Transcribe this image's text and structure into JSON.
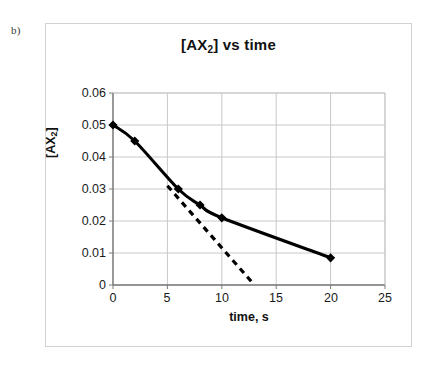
{
  "panel": {
    "label": "b)"
  },
  "chart_data": {
    "type": "line",
    "title": "[AX2] vs time",
    "title_main": "[AX",
    "title_sub": "2",
    "title_tail": "] vs time",
    "xlabel": "time, s",
    "ylabel": "[AX2]",
    "ylabel_main": "[AX",
    "ylabel_sub": "2",
    "ylabel_tail": "]",
    "xlim": [
      0,
      25
    ],
    "ylim": [
      0,
      0.06
    ],
    "grid": true,
    "legend": "none",
    "xticks": [
      0,
      5,
      10,
      15,
      20,
      25
    ],
    "xtick_labels": [
      "0",
      "5",
      "10",
      "15",
      "20",
      "25"
    ],
    "yticks": [
      0,
      0.01,
      0.02,
      0.03,
      0.04,
      0.05,
      0.06
    ],
    "ytick_labels": [
      "0",
      "0.01",
      "0.02",
      "0.03",
      "0.04",
      "0.05",
      "0.06"
    ],
    "series": [
      {
        "name": "[AX2] decay curve",
        "style": "solid-with-diamond-markers",
        "color": "#000000",
        "x": [
          0,
          2,
          6,
          8,
          10,
          20
        ],
        "values": [
          0.05,
          0.045,
          0.03,
          0.025,
          0.021,
          0.0085
        ]
      },
      {
        "name": "tangent at t=5",
        "style": "dashed",
        "color": "#000000",
        "x": [
          5,
          13
        ],
        "values": [
          0.031,
          0.0
        ]
      }
    ],
    "colors": {
      "curve": "#000000",
      "tangent": "#000000",
      "gridline": "#c8c8c8",
      "axis": "#7a7a7a",
      "frame": "#d2d2d2",
      "text": "#111111"
    }
  }
}
